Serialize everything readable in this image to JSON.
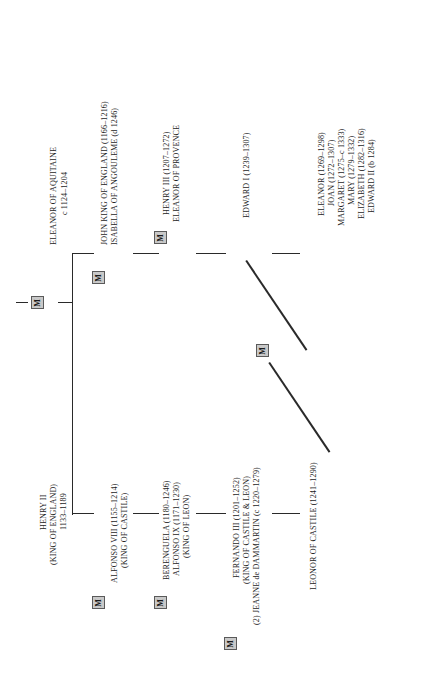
{
  "chart": {
    "orientation": "rotated-90-counterclockwise",
    "marriage_marker_label": "M",
    "line_color": "#2a2a2a",
    "marker_fill_color": "#c9c9c9",
    "marker_border_color": "#5a5a5a",
    "text_color": "#1d1d1d",
    "background_color": "#ffffff"
  },
  "people": {
    "henry_ii": {
      "line1": "HENRY II",
      "line2": "(KING OF ENGLAND)",
      "line3": "1133–1189"
    },
    "eleanor_of_aquitaine": {
      "line1": "ELEANOR OF AQUITAINE",
      "line2": "c 1124–1204"
    },
    "john_king": {
      "line1": "JOHN KING OF ENGLAND (1166–1216)",
      "line2": "ISABELLA OF ANGOULEME (d 1246)"
    },
    "henry_iii": {
      "line1": "HENRY III (1207–1272)",
      "line2": "ELEANOR OF PROVENCE"
    },
    "edward_i": {
      "line1": "EDWARD I (1239–1307)"
    },
    "eleanor_castile_daughter": {
      "line1": "ELEANOR (1161/2–1214)",
      "line2": "ALFONSO VIII (1155–1214)",
      "line3": "(KING OF CASTILE)"
    },
    "berenguela": {
      "line1": "BERENGUELA (1180–1246)",
      "line2": "ALFONSO IX (1171–1230)",
      "line3": "(KING OF LEON)"
    },
    "fernando_iii": {
      "line1": "FERNANDO III (1201–1252)",
      "line2": "(KING OF CASTILE & LEON)",
      "line3": "(2)  JEANNE de DAMMARTIN (c 1220–1279)"
    },
    "leonor_of_castile": {
      "line1": "LEONOR OF CASTILE (1241–1290)"
    }
  },
  "children_of_edward_i": {
    "items": [
      "ELEANOR (1269–1298)",
      "JOAN (1272–1307)",
      "MARGARET (1275–c 1333)",
      "MARY (1279–1332)",
      "ELIZABETH (1282–1316)",
      "EDWARD II (b 1284)"
    ]
  },
  "marriages": [
    {
      "id": "m-henry-eleanor",
      "label": "M"
    },
    {
      "id": "m-john-isabella",
      "label": "M"
    },
    {
      "id": "m-henry3-eleanor-provence",
      "label": "M"
    },
    {
      "id": "m-eleanor-alfonso8",
      "label": "M"
    },
    {
      "id": "m-berenguela-alfonso9",
      "label": "M"
    },
    {
      "id": "m-fernando-jeanne",
      "label": "M"
    },
    {
      "id": "m-edward1-leonor",
      "label": "M"
    }
  ]
}
